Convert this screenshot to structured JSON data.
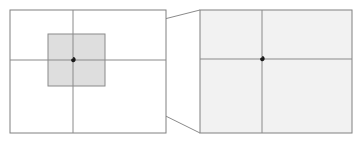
{
  "figure": {
    "background_color": "#ffffff",
    "width": 363,
    "height": 145
  },
  "colors": {
    "frame_stroke": "#808080",
    "axis_stroke": "#8a8a8a",
    "spiral_stroke": "#1a1a1a",
    "zoom_box_fill": "#dedede",
    "zoom_box_stroke": "#8a8a8a",
    "connector_stroke": "#8a8a8a",
    "right_panel_fill": "#f2f2f2",
    "page_background": "#ffffff"
  },
  "panels": [
    {
      "id": "overview-panel",
      "label": "Overview spiral panel",
      "frame": {
        "x": 10,
        "y": 10,
        "width": 156,
        "height": 123
      },
      "fill": "#ffffff",
      "stroke": "#808080",
      "stroke_width": 1,
      "center": {
        "x": 73,
        "y": 60
      },
      "axes": {
        "horizontal_y": 60,
        "vertical_x": 73,
        "horizontal_extent": [
          10,
          166
        ],
        "vertical_extent": [
          10,
          133
        ]
      },
      "spiral": {
        "type": "logarithmic",
        "growth_b": 0.1760913,
        "scale_a": 0.62,
        "theta_start": -16.5,
        "theta_end": 7.55,
        "rotation_deg": 0,
        "stroke": "#1a1a1a",
        "stroke_width": 1.5
      }
    },
    {
      "id": "magnified-panel",
      "label": "Magnified detail panel",
      "frame": {
        "x": 200,
        "y": 10,
        "width": 152,
        "height": 123
      },
      "fill": "#f2f2f2",
      "stroke": "#808080",
      "stroke_width": 1,
      "center": {
        "x": 262,
        "y": 59
      },
      "axes": {
        "horizontal_y": 59,
        "vertical_x": 262,
        "horizontal_extent": [
          200,
          352
        ],
        "vertical_extent": [
          10,
          133
        ]
      },
      "spiral": {
        "type": "logarithmic",
        "growth_b": 0.1760913,
        "scale_a": 0.62,
        "theta_start": -16.5,
        "theta_end": 7.5,
        "rotation_deg": 0,
        "stroke": "#1a1a1a",
        "stroke_width": 1.5
      }
    }
  ],
  "zoom_box": {
    "label": "Magnified region selector",
    "x": 48,
    "y": 34,
    "width": 57,
    "height": 52,
    "fill": "#dedede",
    "stroke": "#8a8a8a",
    "stroke_width": 1
  },
  "connectors": [
    {
      "id": "connector-top",
      "label": "Top zoom connector line",
      "from": {
        "x": 105,
        "y": 34
      },
      "to": {
        "x": 200,
        "y": 10
      },
      "stroke": "#8a8a8a",
      "stroke_width": 1
    },
    {
      "id": "connector-bottom",
      "label": "Bottom zoom connector line",
      "from": {
        "x": 105,
        "y": 86
      },
      "to": {
        "x": 200,
        "y": 133
      },
      "stroke": "#8a8a8a",
      "stroke_width": 1
    }
  ],
  "chart_data": {
    "type": "line",
    "subtitle": "",
    "xlabel": "",
    "ylabel": "",
    "grid": false,
    "legend": null,
    "annotations": [
      "Gray square marks the magnified region",
      "Two gray lines connect the region to the detail panel",
      "Detail panel reproduces the same spiral shape (self-similarity)"
    ],
    "series": [
      {
        "name": "overview-spiral",
        "curve": "r = a * exp(b * theta)",
        "a": 0.62,
        "b": 0.1760913,
        "theta_range": [
          -16.5,
          7.55
        ],
        "center": [
          73,
          60
        ],
        "units": "pixels"
      },
      {
        "name": "magnified-spiral",
        "curve": "r = a * exp(b * theta)",
        "a": 0.62,
        "b": 0.1760913,
        "theta_range": [
          -16.5,
          7.5
        ],
        "center": [
          262,
          59
        ],
        "magnification": 2.67,
        "units": "pixels"
      }
    ],
    "axis_lines": [
      {
        "panel": "overview-panel",
        "orientation": "horizontal",
        "value": 60
      },
      {
        "panel": "overview-panel",
        "orientation": "vertical",
        "value": 73
      },
      {
        "panel": "magnified-panel",
        "orientation": "horizontal",
        "value": 59
      },
      {
        "panel": "magnified-panel",
        "orientation": "vertical",
        "value": 262
      }
    ]
  }
}
